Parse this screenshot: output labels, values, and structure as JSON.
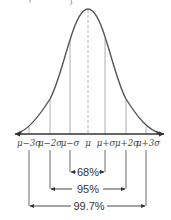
{
  "diagram": {
    "title_fragment": "",
    "type": "normal-distribution-empirical-rule",
    "colors": {
      "curve": "#555555",
      "axis": "#333333",
      "guide_lines": "#999999",
      "mean_line": "#aaaaaa",
      "text": "#333333",
      "background": "#ffffff"
    },
    "axis_labels": [
      {
        "id": "m3",
        "label": "μ−3σ",
        "sigma": -3
      },
      {
        "id": "m2",
        "label": "μ−2σ",
        "sigma": -2
      },
      {
        "id": "m1",
        "label": "μ−σ",
        "sigma": -1
      },
      {
        "id": "mu",
        "label": "μ",
        "sigma": 0
      },
      {
        "id": "p1",
        "label": "μ+σ",
        "sigma": 1
      },
      {
        "id": "p2",
        "label": "μ+2σ",
        "sigma": 2
      },
      {
        "id": "p3",
        "label": "μ+3σ",
        "sigma": 3
      }
    ],
    "intervals": [
      {
        "label": "68%",
        "range_sigma": [
          -1,
          1
        ]
      },
      {
        "label": "95%",
        "range_sigma": [
          -2,
          2
        ]
      },
      {
        "label": "99.7%",
        "range_sigma": [
          -3,
          3
        ]
      }
    ]
  }
}
